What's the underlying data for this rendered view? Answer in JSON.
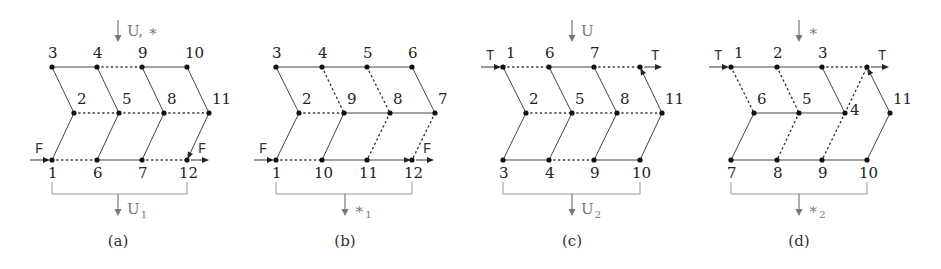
{
  "colors": {
    "edge": "#444444",
    "node": "#111111",
    "annotation": "#777777",
    "bracket": "#999999"
  },
  "panels": [
    {
      "id": "a",
      "caption": "(a)",
      "top_op": {
        "label": "U, ∗",
        "x": 118
      },
      "bottom_op": {
        "label": "U",
        "sub": "1",
        "x": 118
      },
      "bracket": {
        "x1": 52,
        "x2": 187
      },
      "io": {
        "symbol": "F",
        "row": "bottom",
        "left_x": 52,
        "right_x": 187
      },
      "nodes": [
        {
          "id": "3",
          "x": 52,
          "y": 67,
          "lx": -4,
          "ly": -9
        },
        {
          "id": "4",
          "x": 97,
          "y": 67,
          "lx": -4,
          "ly": -9
        },
        {
          "id": "9",
          "x": 142,
          "y": 67,
          "lx": -4,
          "ly": -9
        },
        {
          "id": "10",
          "x": 187,
          "y": 67,
          "lx": -2,
          "ly": -9
        },
        {
          "id": "2",
          "x": 74,
          "y": 113,
          "lx": 3,
          "ly": -9
        },
        {
          "id": "5",
          "x": 119,
          "y": 113,
          "lx": 3,
          "ly": -9
        },
        {
          "id": "8",
          "x": 164,
          "y": 113,
          "lx": 3,
          "ly": -9
        },
        {
          "id": "11",
          "x": 209,
          "y": 113,
          "lx": 3,
          "ly": -9
        },
        {
          "id": "1",
          "x": 52,
          "y": 160,
          "lx": -4,
          "ly": 18
        },
        {
          "id": "6",
          "x": 97,
          "y": 160,
          "lx": -4,
          "ly": 18
        },
        {
          "id": "7",
          "x": 142,
          "y": 160,
          "lx": -4,
          "ly": 18
        },
        {
          "id": "12",
          "x": 187,
          "y": 160,
          "lx": -8,
          "ly": 18
        }
      ],
      "edges": [
        {
          "from": "3",
          "to": "4",
          "style": "solid"
        },
        {
          "from": "4",
          "to": "9",
          "style": "dotted"
        },
        {
          "from": "9",
          "to": "10",
          "style": "solid"
        },
        {
          "from": "3",
          "to": "2",
          "style": "solid"
        },
        {
          "from": "4",
          "to": "5",
          "style": "solid"
        },
        {
          "from": "9",
          "to": "8",
          "style": "solid"
        },
        {
          "from": "10",
          "to": "11",
          "style": "solid"
        },
        {
          "from": "2",
          "to": "5",
          "style": "dotted"
        },
        {
          "from": "5",
          "to": "8",
          "style": "dotted"
        },
        {
          "from": "8",
          "to": "11",
          "style": "dotted"
        },
        {
          "from": "2",
          "to": "1",
          "style": "solid"
        },
        {
          "from": "5",
          "to": "6",
          "style": "solid"
        },
        {
          "from": "8",
          "to": "7",
          "style": "solid"
        },
        {
          "from": "11",
          "to": "12",
          "style": "solid-arrow"
        },
        {
          "from": "1",
          "to": "6",
          "style": "dotted"
        },
        {
          "from": "6",
          "to": "7",
          "style": "solid"
        },
        {
          "from": "7",
          "to": "12",
          "style": "dotted"
        }
      ]
    },
    {
      "id": "b",
      "caption": "(b)",
      "top_op": null,
      "bottom_op": {
        "label": "∗",
        "sub": "1",
        "x": 345
      },
      "bracket": {
        "x1": 276,
        "x2": 412
      },
      "io": {
        "symbol": "F",
        "row": "bottom",
        "left_x": 276,
        "right_x": 412
      },
      "nodes": [
        {
          "id": "3",
          "x": 276,
          "y": 67,
          "lx": -4,
          "ly": -9
        },
        {
          "id": "4",
          "x": 322,
          "y": 67,
          "lx": -4,
          "ly": -9
        },
        {
          "id": "5",
          "x": 367,
          "y": 67,
          "lx": -4,
          "ly": -9
        },
        {
          "id": "6",
          "x": 412,
          "y": 67,
          "lx": -4,
          "ly": -9
        },
        {
          "id": "2",
          "x": 299,
          "y": 113,
          "lx": 3,
          "ly": -9
        },
        {
          "id": "9",
          "x": 344,
          "y": 113,
          "lx": 3,
          "ly": -9
        },
        {
          "id": "8",
          "x": 390,
          "y": 113,
          "lx": 3,
          "ly": -9
        },
        {
          "id": "7",
          "x": 435,
          "y": 113,
          "lx": 3,
          "ly": -9
        },
        {
          "id": "1",
          "x": 276,
          "y": 160,
          "lx": -4,
          "ly": 18
        },
        {
          "id": "10",
          "x": 322,
          "y": 160,
          "lx": -8,
          "ly": 18
        },
        {
          "id": "11",
          "x": 367,
          "y": 160,
          "lx": -8,
          "ly": 18
        },
        {
          "id": "12",
          "x": 412,
          "y": 160,
          "lx": -8,
          "ly": 18
        }
      ],
      "edges": [
        {
          "from": "3",
          "to": "4",
          "style": "solid"
        },
        {
          "from": "4",
          "to": "5",
          "style": "solid"
        },
        {
          "from": "5",
          "to": "6",
          "style": "solid"
        },
        {
          "from": "3",
          "to": "2",
          "style": "solid"
        },
        {
          "from": "4",
          "to": "9",
          "style": "dotted"
        },
        {
          "from": "5",
          "to": "8",
          "style": "dotted"
        },
        {
          "from": "6",
          "to": "7",
          "style": "solid"
        },
        {
          "from": "2",
          "to": "9",
          "style": "dotted"
        },
        {
          "from": "9",
          "to": "8",
          "style": "solid"
        },
        {
          "from": "8",
          "to": "7",
          "style": "solid"
        },
        {
          "from": "2",
          "to": "1",
          "style": "solid"
        },
        {
          "from": "9",
          "to": "10",
          "style": "solid"
        },
        {
          "from": "8",
          "to": "11",
          "style": "dotted"
        },
        {
          "from": "7",
          "to": "12",
          "style": "dotted"
        },
        {
          "from": "1",
          "to": "10",
          "style": "dotted"
        },
        {
          "from": "10",
          "to": "11",
          "style": "solid"
        },
        {
          "from": "11",
          "to": "12",
          "style": "solid-arrow"
        }
      ]
    },
    {
      "id": "c",
      "caption": "(c)",
      "top_op": {
        "label": "U",
        "x": 572
      },
      "bottom_op": {
        "label": "U",
        "sub": "2",
        "x": 572
      },
      "bracket": {
        "x1": 503,
        "x2": 640
      },
      "io": {
        "symbol": "T",
        "row": "top",
        "left_x": 503,
        "right_x": 640
      },
      "nodes": [
        {
          "id": "1",
          "x": 503,
          "y": 67,
          "lx": 3,
          "ly": -9
        },
        {
          "id": "6",
          "x": 549,
          "y": 67,
          "lx": -4,
          "ly": -9
        },
        {
          "id": "7",
          "x": 594,
          "y": 67,
          "lx": -4,
          "ly": -9
        },
        {
          "id": "",
          "x": 640,
          "y": 67,
          "lx": 0,
          "ly": 0
        },
        {
          "id": "2",
          "x": 526,
          "y": 113,
          "lx": 3,
          "ly": -9
        },
        {
          "id": "5",
          "x": 572,
          "y": 113,
          "lx": 3,
          "ly": -9
        },
        {
          "id": "8",
          "x": 617,
          "y": 113,
          "lx": 3,
          "ly": -9
        },
        {
          "id": "11",
          "x": 662,
          "y": 113,
          "lx": 3,
          "ly": -9
        },
        {
          "id": "3",
          "x": 503,
          "y": 160,
          "lx": -4,
          "ly": 18
        },
        {
          "id": "4",
          "x": 549,
          "y": 160,
          "lx": -4,
          "ly": 18
        },
        {
          "id": "9",
          "x": 594,
          "y": 160,
          "lx": -4,
          "ly": 18
        },
        {
          "id": "10",
          "x": 640,
          "y": 160,
          "lx": -8,
          "ly": 18
        }
      ],
      "edges": [
        {
          "from": "1",
          "to": "6",
          "style": "dotted"
        },
        {
          "from": "6",
          "to": "7",
          "style": "solid"
        },
        {
          "from": "7",
          "to": "",
          "style": "dotted"
        },
        {
          "from": "1",
          "to": "2",
          "style": "solid"
        },
        {
          "from": "6",
          "to": "5",
          "style": "solid"
        },
        {
          "from": "7",
          "to": "8",
          "style": "solid"
        },
        {
          "from": "11",
          "to": "",
          "style": "solid-arrow"
        },
        {
          "from": "2",
          "to": "5",
          "style": "dotted"
        },
        {
          "from": "5",
          "to": "8",
          "style": "dotted"
        },
        {
          "from": "8",
          "to": "11",
          "style": "dotted"
        },
        {
          "from": "2",
          "to": "3",
          "style": "solid"
        },
        {
          "from": "5",
          "to": "4",
          "style": "solid"
        },
        {
          "from": "8",
          "to": "9",
          "style": "solid"
        },
        {
          "from": "11",
          "to": "10",
          "style": "solid"
        },
        {
          "from": "3",
          "to": "4",
          "style": "solid"
        },
        {
          "from": "4",
          "to": "9",
          "style": "dotted"
        },
        {
          "from": "9",
          "to": "10",
          "style": "solid"
        }
      ]
    },
    {
      "id": "d",
      "caption": "(d)",
      "top_op": {
        "label": "∗",
        "x": 799
      },
      "bottom_op": {
        "label": "∗",
        "sub": "2",
        "x": 799
      },
      "bracket": {
        "x1": 731,
        "x2": 867
      },
      "io": {
        "symbol": "T",
        "row": "top",
        "left_x": 731,
        "right_x": 867
      },
      "nodes": [
        {
          "id": "1",
          "x": 731,
          "y": 67,
          "lx": 3,
          "ly": -9
        },
        {
          "id": "2",
          "x": 777,
          "y": 67,
          "lx": -4,
          "ly": -9
        },
        {
          "id": "3",
          "x": 822,
          "y": 67,
          "lx": -4,
          "ly": -9
        },
        {
          "id": "",
          "x": 867,
          "y": 67,
          "lx": 0,
          "ly": 0
        },
        {
          "id": "6",
          "x": 754,
          "y": 113,
          "lx": 3,
          "ly": -9
        },
        {
          "id": "5",
          "x": 799,
          "y": 113,
          "lx": 3,
          "ly": -9
        },
        {
          "id": "4",
          "x": 845,
          "y": 113,
          "lx": 5,
          "ly": 2
        },
        {
          "id": "11",
          "x": 890,
          "y": 113,
          "lx": 3,
          "ly": -9
        },
        {
          "id": "7",
          "x": 731,
          "y": 160,
          "lx": -4,
          "ly": 18
        },
        {
          "id": "8",
          "x": 777,
          "y": 160,
          "lx": -4,
          "ly": 18
        },
        {
          "id": "9",
          "x": 822,
          "y": 160,
          "lx": -4,
          "ly": 18
        },
        {
          "id": "10",
          "x": 867,
          "y": 160,
          "lx": -8,
          "ly": 18
        }
      ],
      "edges": [
        {
          "from": "1",
          "to": "2",
          "style": "solid"
        },
        {
          "from": "2",
          "to": "3",
          "style": "solid"
        },
        {
          "from": "3",
          "to": "",
          "style": "dotted"
        },
        {
          "from": "1",
          "to": "6",
          "style": "dotted"
        },
        {
          "from": "2",
          "to": "5",
          "style": "dotted"
        },
        {
          "from": "3",
          "to": "4",
          "style": "solid"
        },
        {
          "from": "4",
          "to": "",
          "style": "dotted"
        },
        {
          "from": "11",
          "to": "",
          "style": "solid-arrow"
        },
        {
          "from": "6",
          "to": "5",
          "style": "solid"
        },
        {
          "from": "5",
          "to": "4",
          "style": "solid"
        },
        {
          "from": "6",
          "to": "7",
          "style": "solid"
        },
        {
          "from": "5",
          "to": "8",
          "style": "dotted"
        },
        {
          "from": "4",
          "to": "9",
          "style": "dotted"
        },
        {
          "from": "11",
          "to": "10",
          "style": "solid"
        },
        {
          "from": "7",
          "to": "8",
          "style": "solid"
        },
        {
          "from": "8",
          "to": "9",
          "style": "solid"
        },
        {
          "from": "9",
          "to": "10",
          "style": "solid"
        }
      ]
    }
  ]
}
